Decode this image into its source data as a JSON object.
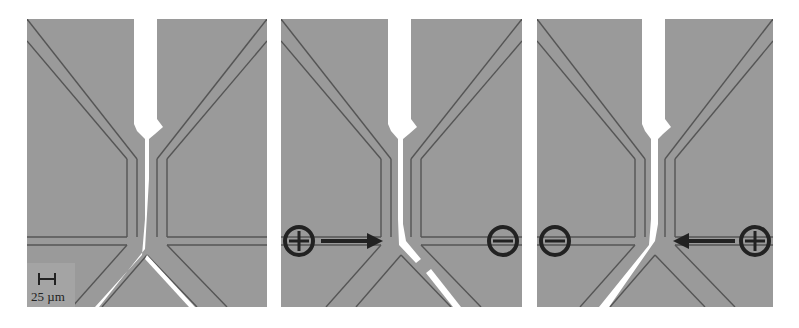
{
  "figure": {
    "panels": [
      {
        "id": "panel-1",
        "stream_direction": "straight-split",
        "electrodes": null
      },
      {
        "id": "panel-2",
        "stream_direction": "right",
        "electrodes": {
          "left": "+",
          "right": "−"
        },
        "arrow": "right"
      },
      {
        "id": "panel-3",
        "stream_direction": "left",
        "electrodes": {
          "left": "−",
          "right": "+"
        },
        "arrow": "left"
      }
    ],
    "scale_bar": {
      "label": "25 µm"
    }
  },
  "colors": {
    "background": "#9a9a9a",
    "channel_wall": "#555555",
    "stream": "#ffffff",
    "marker": "#222222"
  }
}
